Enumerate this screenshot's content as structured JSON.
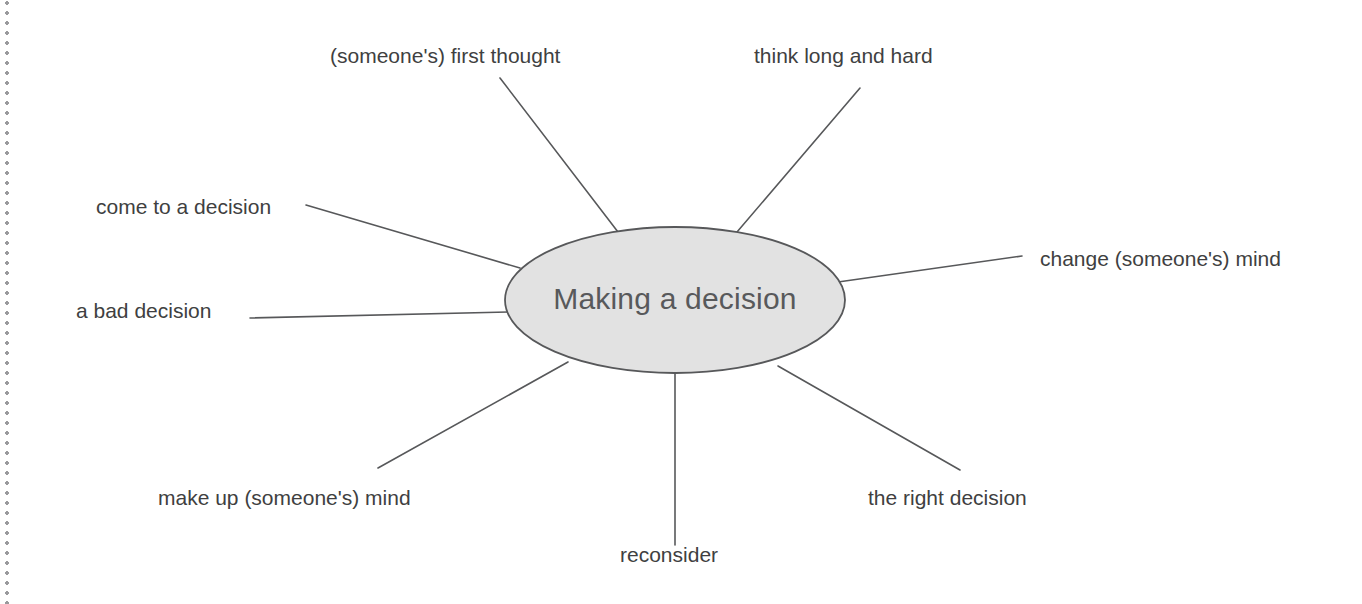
{
  "page": {
    "width": 1362,
    "height": 604,
    "background": "#ffffff",
    "margin_rule": "dotted-vertical-left"
  },
  "diagram": {
    "type": "mind-map",
    "center": {
      "label": "Making a decision",
      "shape": "ellipse",
      "cx": 675,
      "cy": 300,
      "rx": 170,
      "ry": 73,
      "fill": "#e2e2e2",
      "stroke": "#57585a",
      "text_color": "#58595b"
    },
    "line_color": "#57585a",
    "label_color": "#403f41",
    "nodes": [
      {
        "id": "first-thought",
        "label": "(someone's) first thought",
        "label_x": 330,
        "label_y": 45,
        "line": {
          "x1": 500,
          "y1": 78,
          "x2": 618,
          "y2": 232
        }
      },
      {
        "id": "think-long-and-hard",
        "label": "think long and hard",
        "label_x": 754,
        "label_y": 45,
        "line": {
          "x1": 860,
          "y1": 88,
          "x2": 737,
          "y2": 232
        }
      },
      {
        "id": "come-to-a-decision",
        "label": "come to a decision",
        "label_x": 96,
        "label_y": 196,
        "line": {
          "x1": 306,
          "y1": 205,
          "x2": 520,
          "y2": 268
        }
      },
      {
        "id": "change-someones-mind",
        "label": "change (someone's) mind",
        "label_x": 1040,
        "label_y": 248,
        "line": {
          "x1": 1022,
          "y1": 256,
          "x2": 838,
          "y2": 282
        }
      },
      {
        "id": "a-bad-decision",
        "label": "a bad decision",
        "label_x": 76,
        "label_y": 300,
        "line": {
          "x1": 250,
          "y1": 318,
          "x2": 508,
          "y2": 312
        }
      },
      {
        "id": "make-up-someones-mind",
        "label": "make up (someone's) mind",
        "label_x": 158,
        "label_y": 487,
        "line": {
          "x1": 378,
          "y1": 468,
          "x2": 568,
          "y2": 362
        }
      },
      {
        "id": "reconsider",
        "label": "reconsider",
        "label_x": 620,
        "label_y": 544,
        "line": {
          "x1": 675,
          "y1": 545,
          "x2": 675,
          "y2": 374
        }
      },
      {
        "id": "the-right-decision",
        "label": "the right decision",
        "label_x": 868,
        "label_y": 487,
        "line": {
          "x1": 960,
          "y1": 470,
          "x2": 778,
          "y2": 366
        }
      }
    ]
  }
}
